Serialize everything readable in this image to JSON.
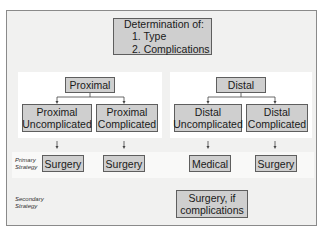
{
  "title_box": {
    "heading": "Determination of:",
    "items": [
      "1. Type",
      "2. Complications"
    ]
  },
  "proximal": {
    "label": "Proximal",
    "uncomplicated": {
      "line1": "Proximal",
      "line2": "Uncomplicated"
    },
    "complicated": {
      "line1": "Proximal",
      "line2": "Complicated"
    },
    "primary_uncomplicated": "Surgery",
    "primary_complicated": "Surgery"
  },
  "distal": {
    "label": "Distal",
    "uncomplicated": {
      "line1": "Distal",
      "line2": "Uncomplicated"
    },
    "complicated": {
      "line1": "Distal",
      "line2": "Complicated"
    },
    "primary_uncomplicated": "Medical",
    "primary_complicated": "Surgery",
    "secondary": {
      "line1": "Surgery, if",
      "line2": "complications"
    }
  },
  "row_labels": {
    "primary": {
      "line1": "Primary",
      "line2": "Strategy"
    },
    "secondary": {
      "line1": "Secondary",
      "line2": "Strategy"
    }
  },
  "colors": {
    "box_fill": "#cfcfcf",
    "box_border": "#5e5e5e",
    "frame_bg": "#f1f1f0",
    "panel_bg": "#ffffff"
  }
}
